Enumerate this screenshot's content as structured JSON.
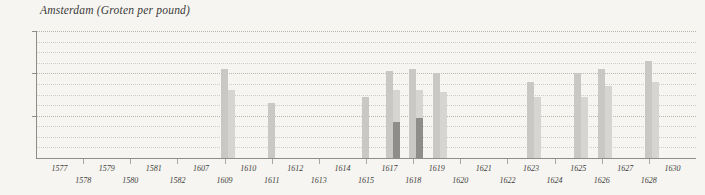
{
  "chart_data": {
    "type": "bar",
    "title": "Amsterdam (Groten per pound)",
    "xlabel": "",
    "ylabel": "",
    "ylim": [
      0,
      30
    ],
    "y_ticks": [
      10,
      20,
      30
    ],
    "y_tick_labels": [
      "10",
      "20",
      "30"
    ],
    "gridlines": [
      2.5,
      5,
      7.5,
      10,
      12.5,
      15,
      17.5,
      20,
      22.5,
      25,
      27.5,
      30
    ],
    "grid": true,
    "legend": "none",
    "categories": [
      "1577",
      "1578",
      "1579",
      "1580",
      "1581",
      "1582",
      "1607",
      "1609",
      "1610",
      "1611",
      "1612",
      "1613",
      "1614",
      "1615",
      "1617",
      "1618",
      "1619",
      "1620",
      "1621",
      "1622",
      "1623",
      "1624",
      "1625",
      "1626",
      "1627",
      "1628",
      "1630"
    ],
    "series": [
      {
        "name": "high",
        "color": "#c9c8c5",
        "values": [
          null,
          null,
          null,
          null,
          null,
          null,
          null,
          21.0,
          null,
          13.0,
          null,
          null,
          null,
          14.5,
          20.5,
          21.0,
          20.0,
          null,
          null,
          null,
          18.0,
          null,
          20.0,
          21.0,
          null,
          23.0,
          null
        ]
      },
      {
        "name": "low",
        "color": "#d6d5d2",
        "values": [
          null,
          null,
          null,
          null,
          null,
          null,
          null,
          16.0,
          null,
          null,
          null,
          null,
          null,
          null,
          16.0,
          16.0,
          15.5,
          null,
          null,
          null,
          14.5,
          null,
          14.5,
          17.0,
          null,
          18.0,
          null
        ]
      },
      {
        "name": "dark",
        "color": "#8e8d8a",
        "values": [
          null,
          null,
          null,
          null,
          null,
          null,
          null,
          null,
          null,
          null,
          null,
          null,
          null,
          null,
          8.5,
          9.5,
          null,
          null,
          null,
          null,
          null,
          null,
          null,
          null,
          null,
          null,
          null
        ]
      }
    ],
    "x_label_rows": [
      {
        "row": 0,
        "labels": [
          "1577",
          "1579",
          "1581",
          "1607",
          "1610",
          "1612",
          "1614",
          "1617",
          "1619",
          "1621",
          "1623",
          "1625",
          "1627",
          "1630"
        ]
      },
      {
        "row": 1,
        "labels": [
          "1578",
          "1580",
          "1582",
          "1609",
          "1611",
          "1613",
          "1615",
          "1618",
          "1620",
          "1622",
          "1624",
          "1626",
          "1628"
        ]
      }
    ]
  },
  "colors": {
    "background": "#f6f5f1",
    "axis": "#8f8d88",
    "grid": "#cfcdc6",
    "text": "#3b3a38",
    "bar_high": "#c9c8c5",
    "bar_low": "#d6d5d2",
    "bar_dark": "#8e8d8a"
  }
}
